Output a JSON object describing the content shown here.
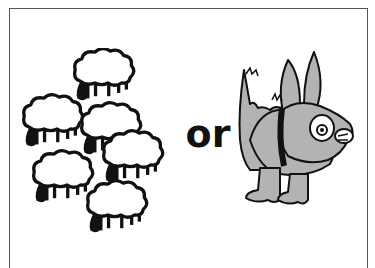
{
  "panel": {
    "left_subject": "flock of sheep",
    "left_count": 6,
    "connector_text": "or",
    "right_subject": "dog"
  },
  "colors": {
    "background": "#ffffff",
    "frame_border": "#555555",
    "outline": "#111111",
    "sheep_fill": "#ffffff",
    "dog_fill": "#b3b3b3",
    "text": "#111111"
  },
  "icons": {
    "sheep": "sheep-icon",
    "dog": "dog-icon"
  }
}
